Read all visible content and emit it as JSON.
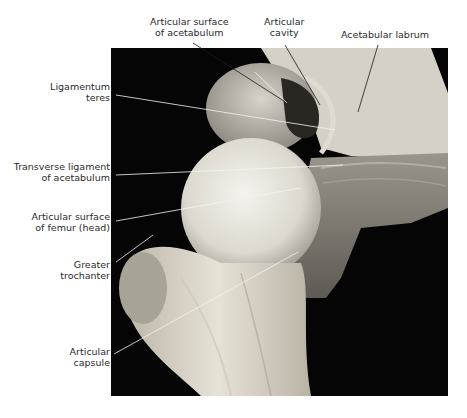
{
  "figure": {
    "labels": [
      {
        "id": "articular-surface-acetabulum",
        "lines": [
          "Articular surface",
          "of acetabulum"
        ]
      },
      {
        "id": "articular-cavity",
        "lines": [
          "Articular",
          "cavity"
        ]
      },
      {
        "id": "acetabular-labrum",
        "lines": [
          "Acetabular labrum"
        ]
      },
      {
        "id": "ligamentum-teres",
        "lines": [
          "Ligamentum",
          "teres"
        ]
      },
      {
        "id": "transverse-ligament",
        "lines": [
          "Transverse ligament",
          "of acetabulum"
        ]
      },
      {
        "id": "articular-surface-femur",
        "lines": [
          "Articular surface",
          "of femur (head)"
        ]
      },
      {
        "id": "greater-trochanter",
        "lines": [
          "Greater",
          "trochanter"
        ]
      },
      {
        "id": "articular-capsule",
        "lines": [
          "Articular",
          "capsule"
        ]
      }
    ]
  },
  "colors": {
    "background": "#000000",
    "bone": "#e9e4d8",
    "tissue": "#c9c3b6",
    "leader": "#f2f2f2",
    "text": "#2a2a2a"
  }
}
